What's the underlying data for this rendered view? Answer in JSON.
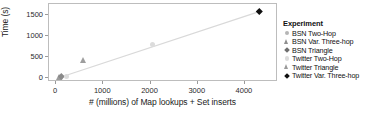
{
  "chart_data": {
    "type": "scatter",
    "title": "",
    "xlabel": "# (millions) of Map lookups + Set inserts",
    "ylabel": "Time (s)",
    "xlim": [
      -150,
      4700
    ],
    "ylim": [
      -90,
      1760
    ],
    "xticks": [
      "0",
      "1000",
      "2000",
      "3000",
      "4000"
    ],
    "xtick_values": [
      0,
      1000,
      2000,
      3000,
      4000
    ],
    "yticks": [
      "0",
      "500",
      "1000",
      "1500"
    ],
    "ytick_values": [
      0,
      500,
      1000,
      1500
    ],
    "grid": false,
    "legend_position": "right",
    "legend_title": "Experiment",
    "trendline": {
      "x": [
        60,
        4300
      ],
      "y": [
        10,
        1580
      ],
      "color": "#d9d9d9"
    },
    "series": [
      {
        "name": "BSN Two-Hop",
        "marker": "circle",
        "color": "#b8b8b8",
        "points": [
          {
            "x": 95,
            "y": 25
          }
        ]
      },
      {
        "name": "BSN Var. Three-hop",
        "marker": "triangle",
        "color": "#9c9c9c",
        "points": [
          {
            "x": 75,
            "y": 20
          }
        ]
      },
      {
        "name": "BSN Triangle",
        "marker": "diamond",
        "color": "#8a8a8a",
        "points": [
          {
            "x": 110,
            "y": 35
          }
        ]
      },
      {
        "name": "Twitter Two-Hop",
        "marker": "circle",
        "color": "#dcdcdc",
        "points": [
          {
            "x": 230,
            "y": 30
          },
          {
            "x": 2050,
            "y": 800
          }
        ]
      },
      {
        "name": "Twitter Triangle",
        "marker": "triangle",
        "color": "#9e9e9e",
        "points": [
          {
            "x": 570,
            "y": 420
          }
        ]
      },
      {
        "name": "Twitter Var. Three-hop",
        "marker": "diamond",
        "color": "#101010",
        "points": [
          {
            "x": 4300,
            "y": 1580
          }
        ]
      }
    ]
  },
  "legend": {
    "title": "Experiment",
    "items": [
      {
        "label": "BSN Two-Hop",
        "marker": "circle",
        "color": "#b5b5b5"
      },
      {
        "label": "BSN Var. Three-hop",
        "marker": "triangle",
        "color": "#8f8f8f"
      },
      {
        "label": "BSN Triangle",
        "marker": "diamond",
        "color": "#6e6e6e"
      },
      {
        "label": "Twitter Two-Hop",
        "marker": "circle",
        "color": "#dcdcdc"
      },
      {
        "label": "Twitter Triangle",
        "marker": "triangle",
        "color": "#9a9a9a"
      },
      {
        "label": "Twitter Var. Three-hop",
        "marker": "diamond",
        "color": "#101010"
      }
    ]
  },
  "colors": {
    "frame": "#bdbdbd",
    "text": "#1a1a1a",
    "trendline": "#d9d9d9",
    "tick": "#9a9a9a"
  }
}
